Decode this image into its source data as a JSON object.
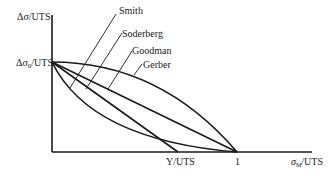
{
  "diagram": {
    "type": "fatigue-mean-stress-diagram",
    "y_axis_label": "Δσ/UTS",
    "x_axis_label": "σ_M/UTS",
    "x_axis_label_main": "σ",
    "x_axis_label_sub": "M",
    "x_axis_label_suffix": "/UTS",
    "y_intercept_label": "Δσ",
    "y_intercept_sub": "0",
    "y_intercept_suffix": "/UTS",
    "x_ticks": [
      {
        "label": "Y/UTS"
      },
      {
        "label": "1"
      }
    ],
    "curves": [
      {
        "name": "Smith",
        "shape": "convex curve to 1"
      },
      {
        "name": "Soderberg",
        "shape": "straight line to Y/UTS"
      },
      {
        "name": "Goodman",
        "shape": "straight line to 1"
      },
      {
        "name": "Gerber",
        "shape": "parabola to 1"
      }
    ],
    "colors": {
      "ink": "#1a1a1a",
      "background": "#ffffff"
    }
  }
}
